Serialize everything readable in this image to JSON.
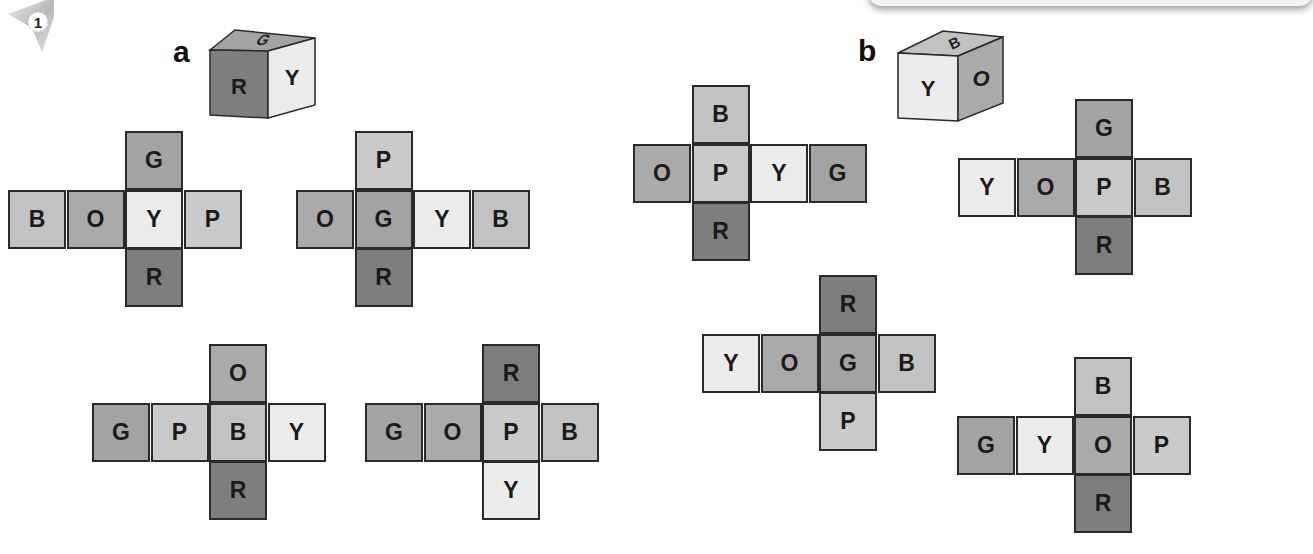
{
  "exercise": {
    "number": "1"
  },
  "colors": {
    "R": "#7e7e7e",
    "G": "#a3a3a3",
    "O": "#aaaaaa",
    "B": "#c2c2c2",
    "P": "#cacaca",
    "Y": "#ececec",
    "border": "#2a2a2a"
  },
  "parts": [
    {
      "label": "a",
      "cube": {
        "front": "R",
        "right": "Y",
        "top": "G"
      },
      "nets": [
        {
          "row": [
            "B",
            "O",
            "Y",
            "P"
          ],
          "top": "G",
          "bottom": "R",
          "column": 2
        },
        {
          "row": [
            "O",
            "G",
            "Y",
            "B"
          ],
          "top": "P",
          "bottom": "R",
          "column": 1
        },
        {
          "row": [
            "G",
            "P",
            "B",
            "Y"
          ],
          "top": "O",
          "bottom": "R",
          "column": 2
        },
        {
          "row": [
            "G",
            "O",
            "P",
            "B"
          ],
          "top": "R",
          "bottom": "Y",
          "column": 2
        }
      ]
    },
    {
      "label": "b",
      "cube": {
        "front": "Y",
        "right": "O",
        "top": "B"
      },
      "nets": [
        {
          "row": [
            "O",
            "P",
            "Y",
            "G"
          ],
          "top": "B",
          "bottom": "R",
          "column": 1
        },
        {
          "row": [
            "Y",
            "O",
            "P",
            "B"
          ],
          "top": "G",
          "bottom": "R",
          "column": 2
        },
        {
          "row": [
            "Y",
            "O",
            "G",
            "B"
          ],
          "top": "R",
          "bottom": "P",
          "column": 2
        },
        {
          "row": [
            "G",
            "Y",
            "O",
            "P"
          ],
          "top": "B",
          "bottom": "R",
          "column": 2
        }
      ]
    }
  ]
}
